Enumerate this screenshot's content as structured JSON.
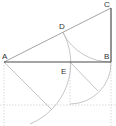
{
  "diagram": {
    "type": "geometric-construction",
    "points": {
      "A": {
        "label": "A",
        "x": 4,
        "y": 62
      },
      "B": {
        "label": "B",
        "x": 111,
        "y": 62
      },
      "C": {
        "label": "C",
        "x": 111,
        "y": 8
      },
      "D": {
        "label": "D",
        "x": 64,
        "y": 32
      },
      "E": {
        "label": "E",
        "x": 70,
        "y": 62
      }
    },
    "segments": [
      {
        "from": "A",
        "to": "B",
        "style": "solid"
      },
      {
        "from": "B",
        "to": "C",
        "style": "solid"
      },
      {
        "from": "A",
        "to": "C",
        "style": "solid-light"
      }
    ],
    "arcs": [
      {
        "center": "A",
        "through": [
          "D",
          "E"
        ],
        "style": "light"
      },
      {
        "center": "C",
        "through": [
          "D",
          "B"
        ],
        "style": "light"
      },
      {
        "center": "E",
        "through": [
          "B"
        ],
        "style": "light"
      }
    ],
    "colors": {
      "main_line": "#555555",
      "light_line": "#b0b0b0",
      "dotted_line": "#cccccc",
      "label": "#333333"
    }
  }
}
